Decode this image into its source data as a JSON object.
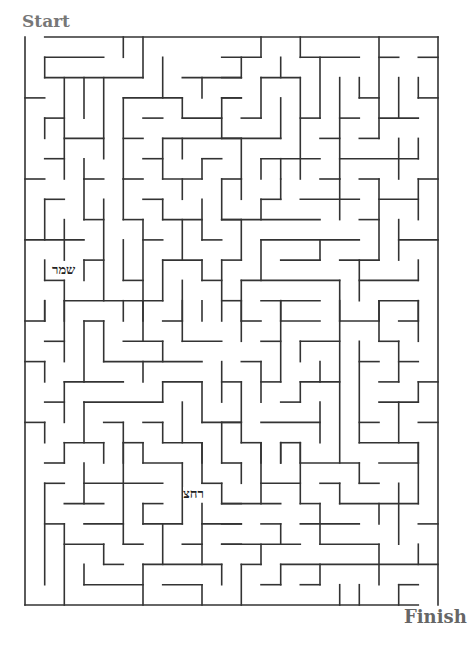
{
  "labels": {
    "start": "Start",
    "finish": "Finish"
  },
  "words": [
    {
      "text": "שמר",
      "x": 52,
      "y": 263
    },
    {
      "text": "רחצ",
      "x": 183,
      "y": 487
    }
  ],
  "maze": {
    "cols": 21,
    "rows": 28,
    "origin": [
      25,
      37
    ],
    "cell": [
      19.667,
      20.286
    ],
    "wall_color": "#333333",
    "entrance": "top, column 0",
    "exit": "bottom, column 20",
    "walls": [
      [
        1,
        0,
        21,
        0
      ],
      [
        0,
        0,
        0,
        28
      ],
      [
        21,
        0,
        21,
        28
      ],
      [
        0,
        28,
        20,
        28
      ],
      [
        5,
        0,
        5,
        1
      ],
      [
        6,
        0,
        6,
        2
      ],
      [
        1,
        1,
        4,
        1
      ],
      [
        1,
        1,
        1,
        2
      ],
      [
        1,
        2,
        6,
        2
      ],
      [
        2,
        2,
        2,
        7
      ],
      [
        3,
        2,
        3,
        4
      ],
      [
        4,
        2,
        4,
        6
      ],
      [
        8,
        2,
        11,
        2
      ],
      [
        7,
        1,
        7,
        3
      ],
      [
        0,
        3,
        1,
        3
      ],
      [
        5,
        3,
        8,
        3
      ],
      [
        5,
        3,
        5,
        7
      ],
      [
        8,
        3,
        8,
        4
      ],
      [
        1,
        4,
        2,
        4
      ],
      [
        1,
        4,
        1,
        5
      ],
      [
        6,
        4,
        7,
        4
      ],
      [
        8,
        4,
        10,
        4
      ],
      [
        9,
        2,
        9,
        3
      ],
      [
        10,
        3,
        10,
        5
      ],
      [
        10,
        3,
        11,
        3
      ],
      [
        2,
        5,
        4,
        5
      ],
      [
        5,
        5,
        6,
        5
      ],
      [
        7,
        5,
        11,
        5
      ],
      [
        8,
        5,
        8,
        6
      ],
      [
        1,
        6,
        2,
        6
      ],
      [
        6,
        6,
        7,
        6
      ],
      [
        9,
        6,
        10,
        6
      ],
      [
        7,
        5,
        7,
        7
      ],
      [
        3,
        6,
        3,
        7
      ],
      [
        9,
        6,
        9,
        7
      ],
      [
        0,
        7,
        1,
        7
      ],
      [
        3,
        7,
        4,
        7
      ],
      [
        5,
        7,
        6,
        7
      ],
      [
        7,
        7,
        9,
        7
      ],
      [
        10,
        7,
        11,
        7
      ],
      [
        12,
        0,
        12,
        1
      ],
      [
        14,
        0,
        14,
        1
      ],
      [
        14,
        1,
        17,
        1
      ],
      [
        18,
        0,
        18,
        5
      ],
      [
        10,
        1,
        12,
        1
      ],
      [
        11,
        1,
        11,
        2
      ],
      [
        10,
        2,
        11,
        2
      ],
      [
        13,
        1,
        13,
        2
      ],
      [
        12,
        2,
        14,
        2
      ],
      [
        12,
        2,
        12,
        4
      ],
      [
        18,
        1,
        19,
        1
      ],
      [
        20,
        1,
        21,
        1
      ],
      [
        15,
        1,
        15,
        4
      ],
      [
        14,
        4,
        15,
        4
      ],
      [
        14,
        2,
        14,
        7
      ],
      [
        16,
        2,
        16,
        7
      ],
      [
        17,
        2,
        17,
        3
      ],
      [
        17,
        3,
        18,
        3
      ],
      [
        19,
        2,
        19,
        4
      ],
      [
        18,
        4,
        20,
        4
      ],
      [
        20,
        2,
        20,
        3
      ],
      [
        20,
        3,
        21,
        3
      ],
      [
        10,
        3,
        11,
        3
      ],
      [
        11,
        4,
        12,
        4
      ],
      [
        13,
        3,
        13,
        5
      ],
      [
        10,
        5,
        13,
        5
      ],
      [
        11,
        5,
        11,
        7
      ],
      [
        16,
        4,
        17,
        4
      ],
      [
        15,
        5,
        16,
        5
      ],
      [
        17,
        5,
        18,
        5
      ],
      [
        12,
        6,
        15,
        6
      ],
      [
        12,
        6,
        12,
        7
      ],
      [
        13,
        6,
        13,
        7
      ],
      [
        16,
        6,
        20,
        6
      ],
      [
        20,
        5,
        20,
        6
      ],
      [
        19,
        5,
        19,
        7
      ],
      [
        17,
        7,
        18,
        7
      ],
      [
        20,
        7,
        21,
        7
      ],
      [
        1,
        8,
        1,
        10
      ],
      [
        1,
        8,
        2,
        8
      ],
      [
        3,
        7,
        3,
        9
      ],
      [
        3,
        9,
        4,
        9
      ],
      [
        4,
        8,
        4,
        13
      ],
      [
        5,
        7,
        5,
        9
      ],
      [
        5,
        9,
        6,
        9
      ],
      [
        6,
        9,
        6,
        13
      ],
      [
        0,
        10,
        3,
        10
      ],
      [
        2,
        9,
        2,
        11
      ],
      [
        6,
        8,
        7,
        8
      ],
      [
        7,
        8,
        7,
        9
      ],
      [
        7,
        9,
        9,
        9
      ],
      [
        8,
        7,
        8,
        8
      ],
      [
        9,
        8,
        9,
        10
      ],
      [
        9,
        10,
        10,
        10
      ],
      [
        10,
        7,
        10,
        9
      ],
      [
        10,
        9,
        11,
        9
      ],
      [
        5,
        10,
        5,
        12
      ],
      [
        5,
        12,
        6,
        12
      ],
      [
        6,
        10,
        7,
        10
      ],
      [
        8,
        9,
        8,
        11
      ],
      [
        7,
        11,
        9,
        11
      ],
      [
        7,
        11,
        7,
        13
      ],
      [
        9,
        11,
        9,
        12
      ],
      [
        9,
        12,
        10,
        12
      ],
      [
        10,
        11,
        10,
        14
      ],
      [
        10,
        11,
        11,
        11
      ],
      [
        3,
        11,
        4,
        11
      ],
      [
        3,
        11,
        3,
        12
      ],
      [
        1,
        11,
        1,
        12
      ],
      [
        1,
        12,
        2,
        12
      ],
      [
        2,
        12,
        2,
        14
      ],
      [
        2,
        13,
        7,
        13
      ],
      [
        1,
        13,
        1,
        14
      ],
      [
        5,
        13,
        5,
        14
      ],
      [
        6,
        13,
        6,
        14
      ],
      [
        8,
        12,
        8,
        14
      ],
      [
        10,
        13,
        11,
        13
      ],
      [
        11,
        7,
        11,
        8
      ],
      [
        13,
        7,
        13,
        8
      ],
      [
        12,
        8,
        13,
        8
      ],
      [
        12,
        8,
        12,
        9
      ],
      [
        14,
        8,
        17,
        8
      ],
      [
        15,
        7,
        16,
        7
      ],
      [
        16,
        7,
        16,
        9
      ],
      [
        18,
        7,
        18,
        11
      ],
      [
        18,
        8,
        20,
        8
      ],
      [
        20,
        7,
        20,
        9
      ],
      [
        10,
        9,
        15,
        9
      ],
      [
        11,
        9,
        11,
        11
      ],
      [
        17,
        9,
        18,
        9
      ],
      [
        19,
        9,
        19,
        11
      ],
      [
        19,
        10,
        21,
        10
      ],
      [
        12,
        10,
        17,
        10
      ],
      [
        12,
        10,
        12,
        12
      ],
      [
        15,
        10,
        15,
        11
      ],
      [
        13,
        11,
        15,
        11
      ],
      [
        16,
        11,
        18,
        11
      ],
      [
        17,
        11,
        17,
        13
      ],
      [
        17,
        12,
        20,
        12
      ],
      [
        20,
        11,
        20,
        12
      ],
      [
        11,
        12,
        16,
        12
      ],
      [
        11,
        12,
        11,
        14
      ],
      [
        16,
        12,
        16,
        14
      ],
      [
        12,
        13,
        15,
        13
      ],
      [
        13,
        13,
        13,
        14
      ],
      [
        18,
        13,
        20,
        13
      ],
      [
        18,
        13,
        18,
        14
      ],
      [
        20,
        13,
        20,
        14
      ],
      [
        0,
        14,
        1,
        14
      ],
      [
        1,
        13,
        1,
        14
      ],
      [
        2,
        13,
        2,
        16
      ],
      [
        1,
        15,
        2,
        15
      ],
      [
        3,
        14,
        3,
        17
      ],
      [
        3,
        14,
        4,
        14
      ],
      [
        4,
        14,
        4,
        16
      ],
      [
        4,
        16,
        9,
        16
      ],
      [
        5,
        15,
        7,
        15
      ],
      [
        6,
        13,
        6,
        15
      ],
      [
        7,
        15,
        7,
        16
      ],
      [
        7,
        14,
        8,
        14
      ],
      [
        8,
        13,
        8,
        15
      ],
      [
        8,
        15,
        10,
        15
      ],
      [
        9,
        13,
        9,
        14
      ],
      [
        0,
        16,
        1,
        16
      ],
      [
        1,
        16,
        1,
        17
      ],
      [
        2,
        17,
        5,
        17
      ],
      [
        2,
        17,
        2,
        19
      ],
      [
        6,
        16,
        6,
        17
      ],
      [
        7,
        17,
        9,
        17
      ],
      [
        7,
        17,
        7,
        18
      ],
      [
        9,
        17,
        9,
        19
      ],
      [
        9,
        19,
        11,
        19
      ],
      [
        10,
        16,
        10,
        18
      ],
      [
        10,
        17,
        11,
        17
      ],
      [
        1,
        18,
        2,
        18
      ],
      [
        3,
        18,
        7,
        18
      ],
      [
        3,
        18,
        3,
        20
      ],
      [
        0,
        19,
        1,
        19
      ],
      [
        1,
        19,
        1,
        20
      ],
      [
        4,
        19,
        5,
        19
      ],
      [
        5,
        19,
        5,
        21
      ],
      [
        6,
        19,
        7,
        19
      ],
      [
        7,
        19,
        7,
        20
      ],
      [
        7,
        20,
        9,
        20
      ],
      [
        8,
        18,
        8,
        20
      ],
      [
        9,
        20,
        9,
        21
      ],
      [
        10,
        19,
        10,
        21
      ],
      [
        2,
        20,
        4,
        20
      ],
      [
        2,
        20,
        2,
        21
      ],
      [
        4,
        20,
        4,
        21
      ],
      [
        5,
        20,
        6,
        20
      ],
      [
        6,
        20,
        6,
        21
      ],
      [
        11,
        13,
        11,
        15
      ],
      [
        11,
        14,
        12,
        14
      ],
      [
        11,
        16,
        12,
        16
      ],
      [
        12,
        16,
        12,
        18
      ],
      [
        12,
        17,
        13,
        17
      ],
      [
        13,
        13,
        13,
        17
      ],
      [
        13,
        14,
        15,
        14
      ],
      [
        12,
        15,
        13,
        15
      ],
      [
        16,
        13,
        16,
        21
      ],
      [
        16,
        14,
        18,
        14
      ],
      [
        18,
        13,
        18,
        15
      ],
      [
        18,
        15,
        19,
        15
      ],
      [
        19,
        15,
        19,
        17
      ],
      [
        19,
        14,
        20,
        14
      ],
      [
        20,
        13,
        20,
        15
      ],
      [
        14,
        15,
        16,
        15
      ],
      [
        14,
        15,
        14,
        16
      ],
      [
        15,
        16,
        15,
        17
      ],
      [
        14,
        17,
        16,
        17
      ],
      [
        14,
        17,
        14,
        18
      ],
      [
        13,
        18,
        14,
        18
      ],
      [
        17,
        15,
        17,
        20
      ],
      [
        17,
        16,
        18,
        16
      ],
      [
        19,
        16,
        20,
        16
      ],
      [
        18,
        17,
        19,
        17
      ],
      [
        20,
        17,
        21,
        17
      ],
      [
        20,
        17,
        20,
        18
      ],
      [
        18,
        18,
        20,
        18
      ],
      [
        19,
        18,
        19,
        20
      ],
      [
        17,
        19,
        18,
        19
      ],
      [
        20,
        19,
        21,
        19
      ],
      [
        10,
        19,
        11,
        19
      ],
      [
        11,
        17,
        11,
        20
      ],
      [
        11,
        20,
        12,
        20
      ],
      [
        12,
        20,
        12,
        21
      ],
      [
        12,
        19,
        15,
        19
      ],
      [
        15,
        18,
        15,
        20
      ],
      [
        17,
        20,
        20,
        20
      ],
      [
        20,
        20,
        20,
        21
      ],
      [
        13,
        20,
        14,
        20
      ],
      [
        13,
        20,
        13,
        21
      ],
      [
        14,
        20,
        14,
        21
      ],
      [
        1,
        21,
        2,
        21
      ],
      [
        6,
        21,
        8,
        21
      ],
      [
        8,
        21,
        8,
        24
      ],
      [
        5,
        20,
        5,
        25
      ],
      [
        5,
        25,
        6,
        25
      ],
      [
        9,
        20,
        9,
        22
      ],
      [
        9,
        22,
        10,
        22
      ],
      [
        10,
        22,
        10,
        23
      ],
      [
        10,
        23,
        11,
        23
      ],
      [
        10,
        21,
        11,
        21
      ],
      [
        1,
        22,
        2,
        22
      ],
      [
        1,
        22,
        1,
        27
      ],
      [
        3,
        21,
        3,
        23
      ],
      [
        3,
        22,
        7,
        22
      ],
      [
        2,
        23,
        4,
        23
      ],
      [
        6,
        23,
        7,
        23
      ],
      [
        6,
        23,
        6,
        24
      ],
      [
        6,
        24,
        8,
        24
      ],
      [
        1,
        24,
        2,
        24
      ],
      [
        2,
        24,
        2,
        28
      ],
      [
        3,
        24,
        5,
        24
      ],
      [
        2,
        25,
        4,
        25
      ],
      [
        4,
        25,
        4,
        26
      ],
      [
        4,
        26,
        5,
        26
      ],
      [
        7,
        24,
        7,
        26
      ],
      [
        8,
        25,
        9,
        25
      ],
      [
        9,
        23,
        9,
        26
      ],
      [
        9,
        24,
        11,
        24
      ],
      [
        10,
        25,
        11,
        25
      ],
      [
        6,
        26,
        10,
        26
      ],
      [
        6,
        26,
        6,
        28
      ],
      [
        10,
        26,
        10,
        27
      ],
      [
        3,
        26,
        3,
        27
      ],
      [
        3,
        27,
        6,
        27
      ],
      [
        7,
        27,
        9,
        27
      ],
      [
        9,
        27,
        9,
        28
      ],
      [
        11,
        21,
        11,
        22
      ],
      [
        12,
        20,
        12,
        23
      ],
      [
        13,
        20,
        13,
        21
      ],
      [
        14,
        20,
        14,
        23
      ],
      [
        14,
        21,
        17,
        21
      ],
      [
        17,
        21,
        17,
        22
      ],
      [
        17,
        22,
        18,
        22
      ],
      [
        18,
        21,
        20,
        21
      ],
      [
        20,
        20,
        20,
        23
      ],
      [
        12,
        22,
        14,
        22
      ],
      [
        15,
        22,
        16,
        22
      ],
      [
        16,
        22,
        16,
        23
      ],
      [
        16,
        23,
        20,
        23
      ],
      [
        19,
        22,
        19,
        25
      ],
      [
        10,
        23,
        13,
        23
      ],
      [
        14,
        23,
        15,
        23
      ],
      [
        15,
        23,
        15,
        25
      ],
      [
        15,
        25,
        18,
        25
      ],
      [
        18,
        23,
        18,
        24
      ],
      [
        10,
        24,
        11,
        24
      ],
      [
        12,
        24,
        13,
        24
      ],
      [
        13,
        24,
        13,
        25
      ],
      [
        10,
        25,
        14,
        25
      ],
      [
        14,
        24,
        17,
        24
      ],
      [
        20,
        24,
        21,
        24
      ],
      [
        12,
        25,
        12,
        26
      ],
      [
        11,
        26,
        12,
        26
      ],
      [
        11,
        26,
        11,
        28
      ],
      [
        20,
        25,
        20,
        26
      ],
      [
        13,
        26,
        21,
        26
      ],
      [
        13,
        26,
        13,
        27
      ],
      [
        12,
        27,
        13,
        27
      ],
      [
        15,
        26,
        15,
        27
      ],
      [
        14,
        27,
        15,
        27
      ],
      [
        18,
        25,
        18,
        27
      ],
      [
        16,
        27,
        16,
        28
      ],
      [
        17,
        27,
        17,
        28
      ],
      [
        19,
        27,
        20,
        27
      ],
      [
        19,
        27,
        19,
        28
      ]
    ]
  }
}
